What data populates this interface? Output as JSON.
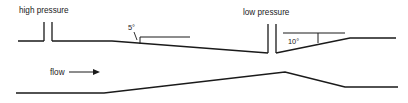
{
  "figure": {
    "type": "cross-section-duct-diagram",
    "background_color": "#ffffff",
    "line_color": "#1a1a1a",
    "width": 408,
    "height": 103
  },
  "labels": {
    "high_pressure": "high pressure",
    "low_pressure": "low pressure",
    "flow": "flow",
    "angle_upstream": "5°",
    "angle_downstream": "10°"
  },
  "geometry": {
    "upper_wall_path": "M 18 41 L 44 41 M 52 41 L 112 41 L 268 53",
    "upper_wall_downstream_path": "M 276 53 L 350 38 L 396 38",
    "lower_wall_path": "M 16 93 L 104 93 L 285 72 L 345 87 L 398 87",
    "high_pressure_port_left": "M 44 22 L 44 41",
    "high_pressure_port_right": "M 52 22 L 52 41",
    "low_pressure_port_left": "M 268 24 L 268 53",
    "low_pressure_port_right": "M 276 24 L 276 53",
    "upstream_reference_line": "M 140 37 L 190 37",
    "upstream_angle_tick": "M 140 37 L 140 44",
    "downstream_reference_line": "M 283 33 L 345 33",
    "downstream_angle_tick": "M 318 33 L 318 43",
    "flow_arrow_line": "M 69 72 L 93 72",
    "flow_arrow_head": "M 93 69 L 100 72 L 93 75 Z",
    "angle_5_leader": "M 134 32 L 137 40",
    "angle_10_leader": ""
  },
  "text_positions": {
    "high_pressure": {
      "x": 19,
      "y": 13
    },
    "low_pressure": {
      "x": 243,
      "y": 15
    },
    "flow": {
      "x": 50,
      "y": 75
    },
    "angle_upstream": {
      "x": 128,
      "y": 30
    },
    "angle_downstream": {
      "x": 288,
      "y": 44
    }
  }
}
